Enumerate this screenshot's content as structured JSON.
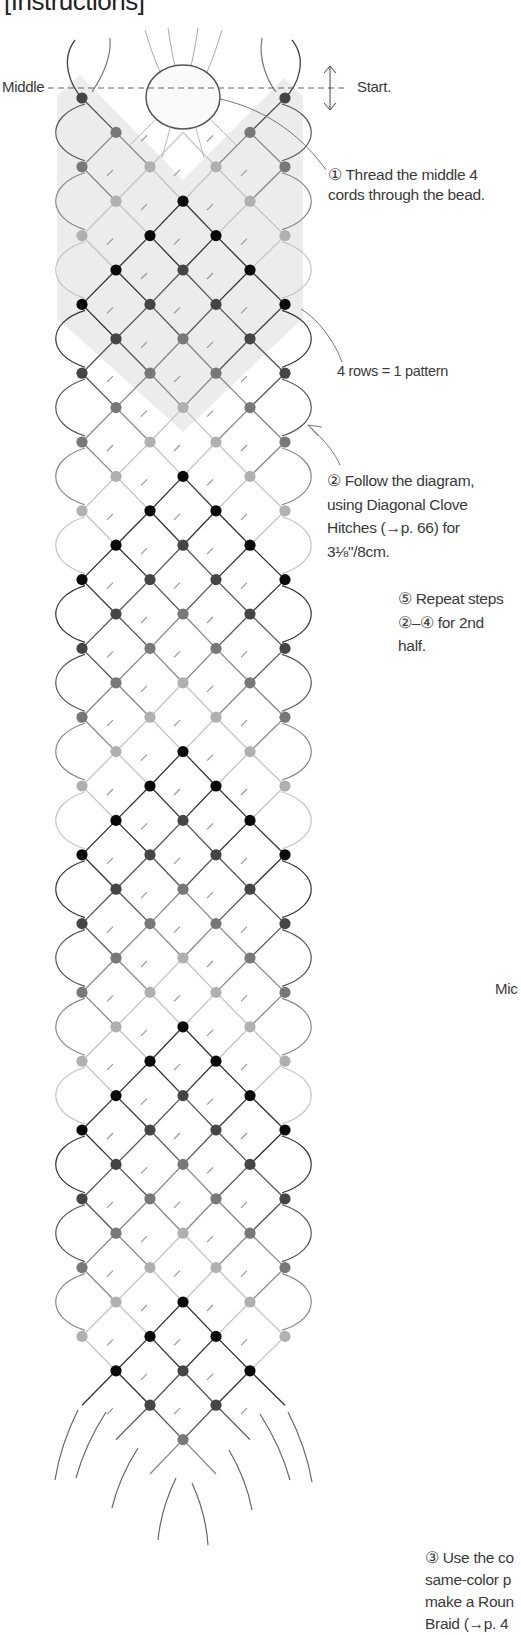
{
  "header": {
    "title": "[Instructions]"
  },
  "labels": {
    "middle_left": "Middle",
    "start": "Start.",
    "middle_right_clipped": "Mic"
  },
  "notes": {
    "step1": [
      "① Thread the middle 4",
      "cords through the bead."
    ],
    "pattern": "4 rows = 1 pattern",
    "step2": [
      "② Follow the diagram,",
      "using Diagonal Clove",
      "Hitches (→p. 66) for",
      "3⅛\"/8cm."
    ],
    "step5": [
      "⑤ Repeat steps",
      "②–④ for 2nd",
      "half."
    ],
    "step3_clipped": [
      "③ Use the co",
      "same-color p",
      "make a Roun",
      "Braid (→p. 4"
    ]
  },
  "diagram": {
    "columns_x": [
      82,
      116,
      150,
      183,
      216,
      250,
      285
    ],
    "first_row_y": 98,
    "row_spacing": 34.4,
    "row_count": 41,
    "knot_color_cycle": [
      "#454545",
      "#787878",
      "#b0b0b0",
      "#0a0a0a"
    ],
    "shade_color": "#ececec",
    "bead": {
      "cx": 183,
      "cy": 97,
      "rx": 37,
      "ry": 32
    },
    "middle_line_y": 88
  }
}
